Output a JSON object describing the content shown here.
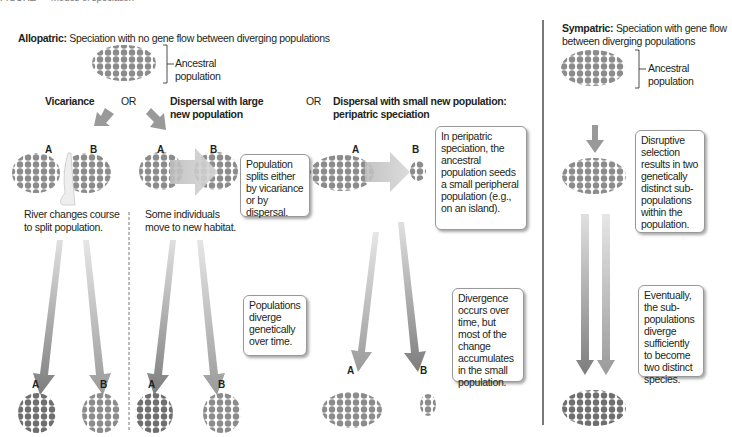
{
  "figure": {
    "title_cut": "FIGURE — Modes of speciation"
  },
  "allopatric": {
    "heading_bold": "Allopatric:",
    "heading_rest": " Speciation with no gene flow between diverging populations",
    "ancestral_label_line1": "Ancestral",
    "ancestral_label_line2": "population",
    "modes": {
      "vicariance": "Vicariance",
      "or1": "OR",
      "dispersal_large_line1": "Dispersal with large",
      "dispersal_large_line2": "new population",
      "or2": "OR",
      "dispersal_small_line1": "Dispersal with small new population:",
      "dispersal_small_line2": "peripatric speciation"
    },
    "labels": {
      "a": "A",
      "b": "B"
    },
    "river_caption_line1": "River changes course",
    "river_caption_line2": "to split population.",
    "habitat_caption_line1": "Some individuals",
    "habitat_caption_line2": "move to new habitat.",
    "callouts": {
      "splits": "Population splits either by vicariance or by dispersal.",
      "diverge": "Populations diverge genetically over time.",
      "peripatric": "In peripatric speciation, the ancestral population seeds a small peripheral population (e.g., on an island).",
      "divergence_small": "Divergence occurs over time, but most of the change accumulates in the small population."
    }
  },
  "sympatric": {
    "heading_bold": "Sympatric:",
    "heading_rest": " Speciation with gene flow between diverging populations",
    "ancestral_label_line1": "Ancestral",
    "ancestral_label_line2": "population",
    "callouts": {
      "disruptive": "Disruptive selection results in two genetically distinct sub-populations within the population.",
      "eventually": "Eventually, the sub-populations diverge sufficiently to become two distinct species."
    }
  },
  "colors": {
    "dot": "#8c8c8c",
    "dot_dark": "#6f6f6f",
    "arrow": "#999999",
    "arrow_light": "#c8c8c8",
    "divider": "#231f20"
  }
}
